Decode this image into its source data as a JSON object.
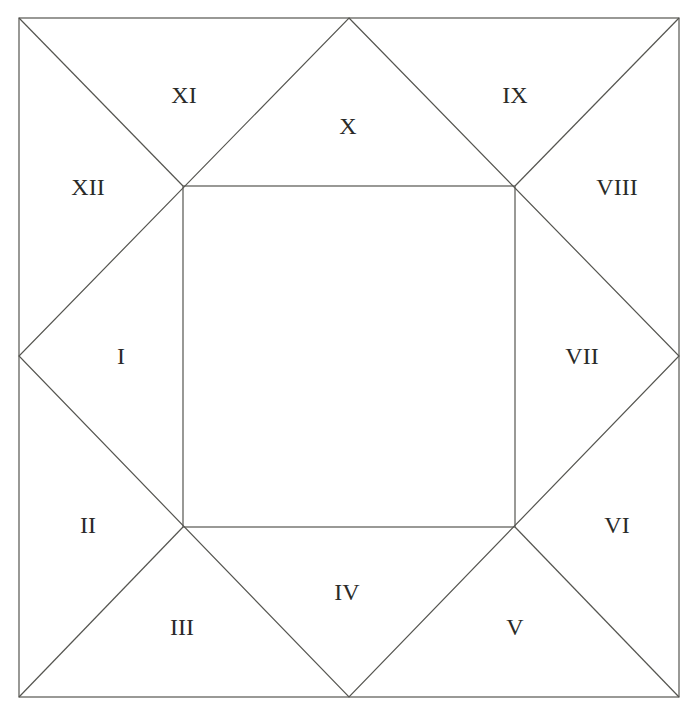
{
  "diagram": {
    "type": "square-house-chart",
    "outer_square": {
      "x1": 19,
      "y1": 18,
      "x2": 679,
      "y2": 697
    },
    "inner_square": {
      "x1": 183,
      "y1": 186,
      "x2": 515,
      "y2": 527
    },
    "midpoints": {
      "x": 349,
      "y": 356
    },
    "line_color": "#555550",
    "label_color": "#2a2a28"
  },
  "houses": [
    {
      "label": "I",
      "x": 121,
      "y": 356
    },
    {
      "label": "II",
      "x": 88,
      "y": 525
    },
    {
      "label": "III",
      "x": 182,
      "y": 627
    },
    {
      "label": "IV",
      "x": 347,
      "y": 592
    },
    {
      "label": "V",
      "x": 515,
      "y": 627
    },
    {
      "label": "VI",
      "x": 617,
      "y": 525
    },
    {
      "label": "VII",
      "x": 582,
      "y": 356
    },
    {
      "label": "VIII",
      "x": 617,
      "y": 187
    },
    {
      "label": "IX",
      "x": 515,
      "y": 95
    },
    {
      "label": "X",
      "x": 348,
      "y": 126
    },
    {
      "label": "XI",
      "x": 184,
      "y": 95
    },
    {
      "label": "XII",
      "x": 88,
      "y": 187
    }
  ]
}
